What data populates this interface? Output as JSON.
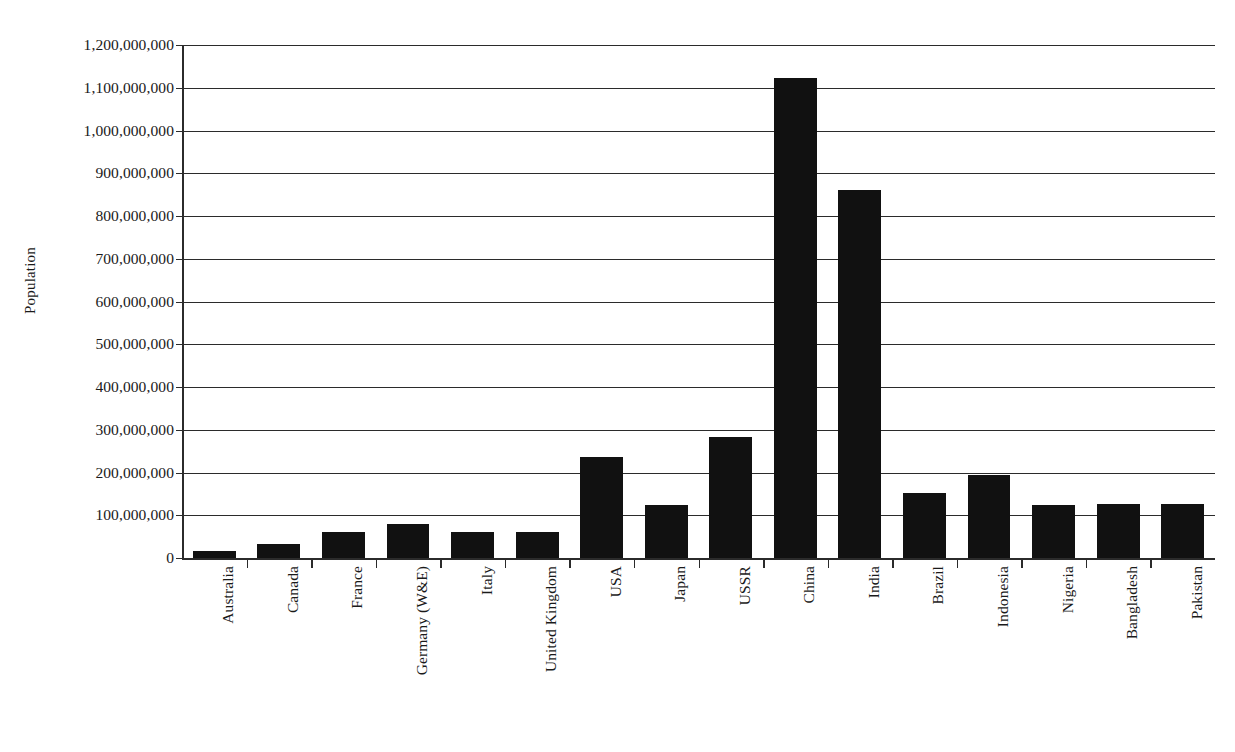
{
  "chart_data": {
    "type": "bar",
    "title": "",
    "xlabel": "",
    "ylabel": "Population",
    "ylim": [
      0,
      1200000000
    ],
    "ytick_step": 100000000,
    "grid": true,
    "legend": "none",
    "bar_color": "#111111",
    "axis_color": "#2b2b2b",
    "categories": [
      "Australia",
      "Canada",
      "France",
      "Germany (W&E)",
      "Italy",
      "United Kingdom",
      "USA",
      "Japan",
      "USSR",
      "China",
      "India",
      "Brazil",
      "Indonesia",
      "Nigeria",
      "Bangladesh",
      "Pakistan"
    ],
    "values": [
      16000000,
      33000000,
      60000000,
      80000000,
      62000000,
      62000000,
      237000000,
      123000000,
      284000000,
      1123000000,
      860000000,
      153000000,
      194000000,
      125000000,
      127000000,
      126000000
    ],
    "ytick_labels": [
      "0",
      "100,000,000",
      "200,000,000",
      "300,000,000",
      "400,000,000",
      "500,000,000",
      "600,000,000",
      "700,000,000",
      "800,000,000",
      "900,000,000",
      "1,000,000,000",
      "1,100,000,000",
      "1,200,000,000"
    ],
    "ytick_values": [
      0,
      100000000,
      200000000,
      300000000,
      400000000,
      500000000,
      600000000,
      700000000,
      800000000,
      900000000,
      1000000000,
      1100000000,
      1200000000
    ]
  }
}
